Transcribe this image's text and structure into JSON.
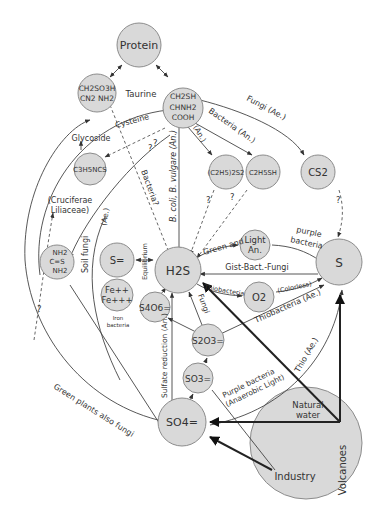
{
  "nodes": {
    "protein": "Protein",
    "taurine_l1": "CH2SO3H",
    "taurine_l2": "CN2  NH2",
    "cysteine_l1": "CH2SH",
    "cysteine_l2": "CHNH2",
    "cysteine_l3": "COOH",
    "c3h5ncs": "C3H5NCS",
    "c2h5s2": "(C2H5)2S2",
    "c2h5sh": "C2H5SH",
    "cs2": "CS2",
    "urea_l1": "NH2",
    "urea_l2": "C=S",
    "urea_l3": "NH2",
    "s2minus": "S=",
    "fe_l1": "Fe++",
    "fe_l2": "Fe+++",
    "h2s": "H2S",
    "light_l1": "Light",
    "light_l2": "An.",
    "s": "S",
    "o2": "O2",
    "s4o6": "S4O6=",
    "s2o3": "S2O3=",
    "so3": "SO3=",
    "so4": "SO4=",
    "volcanoes": "Volcanoes",
    "natural_water_l1": "Natural",
    "natural_water_l2": "water",
    "industry": "Industry"
  },
  "labels": {
    "taurine": "Taurine",
    "cysteine": "Cysteine",
    "glycoside": "Glycoside",
    "cruciferae_l1": "(Cruciferae",
    "cruciferae_l2": "Liliaceae)",
    "fungi_ae": "Fungi (Ae.)",
    "bacteria_an": "Bacteria (An.)",
    "an": "(An.)",
    "bcoli": "B. coli, B. vulgare (An.)",
    "bacteria_q": "Bacteria?",
    "q": "?",
    "soil_fungi": "Soil fungi",
    "ae": "(Ae.)",
    "equilibrium": "Equilibrium",
    "iron_bacteria_l1": "Iron",
    "iron_bacteria_l2": "bacteria",
    "green_and": "Green and",
    "purple_l1": "purple",
    "purple_l2": "bacteria",
    "gist": "Gist-Bact.-Fungi",
    "thiobacteria": "Thiobacteria",
    "colorless": "(Colorless)",
    "thiobacteria_ae": "Thiobacteria (Ae.)",
    "fungi": "Fungi",
    "sulfate_reduction": "Sulfate reduction (An.)",
    "thio_ae": "Thio (Ae.)",
    "purple_anaerobic_l1": "Purple bacteria",
    "purple_anaerobic_l2": "(Anaerobic Light)",
    "green_plants": "Green plants also fungi"
  },
  "colors": {
    "node_fill": "#d9d9d9",
    "node_stroke": "#8c8c8c",
    "line": "#444444",
    "background": "#ffffff"
  }
}
